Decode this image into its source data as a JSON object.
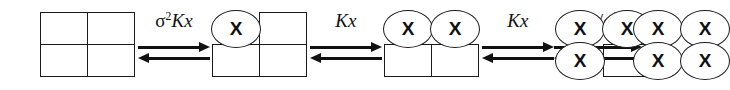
{
  "diagram": {
    "type": "reaction-scheme",
    "background_color": "#ffffff",
    "line_color": "#1a1a1a",
    "bound_marker": "X",
    "states": [
      {
        "id": "state-0",
        "name": "fully-unbound-lattice",
        "bound_count": 0,
        "sites": [
          {
            "position": "top-left",
            "occupied": false,
            "label": ""
          },
          {
            "position": "top-right",
            "occupied": false,
            "label": ""
          },
          {
            "position": "bottom-left",
            "occupied": false,
            "label": ""
          },
          {
            "position": "bottom-right",
            "occupied": false,
            "label": ""
          }
        ]
      },
      {
        "id": "state-1",
        "name": "singly-bound-lattice",
        "bound_count": 1,
        "sites": [
          {
            "position": "top-left",
            "occupied": true,
            "label": "X"
          },
          {
            "position": "top-right",
            "occupied": false,
            "label": ""
          },
          {
            "position": "bottom-left",
            "occupied": false,
            "label": ""
          },
          {
            "position": "bottom-right",
            "occupied": false,
            "label": ""
          }
        ]
      },
      {
        "id": "state-2",
        "name": "doubly-bound-lattice",
        "bound_count": 2,
        "sites": [
          {
            "position": "top-left",
            "occupied": true,
            "label": "X"
          },
          {
            "position": "top-right",
            "occupied": true,
            "label": "X"
          },
          {
            "position": "bottom-left",
            "occupied": false,
            "label": ""
          },
          {
            "position": "bottom-right",
            "occupied": false,
            "label": ""
          }
        ]
      },
      {
        "id": "state-3",
        "name": "triply-bound-lattice",
        "bound_count": 3,
        "sites": [
          {
            "position": "top-left",
            "occupied": true,
            "label": "X"
          },
          {
            "position": "top-right",
            "occupied": true,
            "label": "X"
          },
          {
            "position": "bottom-left",
            "occupied": true,
            "label": "X"
          },
          {
            "position": "bottom-right",
            "occupied": false,
            "label": ""
          }
        ]
      },
      {
        "id": "state-4",
        "name": "fully-bound-lattice",
        "bound_count": 4,
        "sites": [
          {
            "position": "top-left",
            "occupied": true,
            "label": "X"
          },
          {
            "position": "top-right",
            "occupied": true,
            "label": "X"
          },
          {
            "position": "bottom-left",
            "occupied": true,
            "label": "X"
          },
          {
            "position": "bottom-right",
            "occupied": true,
            "label": "X"
          }
        ]
      }
    ],
    "reactions": [
      {
        "id": "rxn-0",
        "name": "first-binding-step",
        "from": "state-0",
        "to": "state-1",
        "reversible": true,
        "constant_text": "σ²Kx",
        "constant_parts": {
          "prefix_sigma": "σ",
          "prefix_exponent": "2",
          "body": "Kx",
          "divisor_sigma": "",
          "divisor_exponent": ""
        }
      },
      {
        "id": "rxn-1",
        "name": "second-binding-step",
        "from": "state-1",
        "to": "state-2",
        "reversible": true,
        "constant_text": "Kx",
        "constant_parts": {
          "prefix_sigma": "",
          "prefix_exponent": "",
          "body": "Kx",
          "divisor_sigma": "",
          "divisor_exponent": ""
        }
      },
      {
        "id": "rxn-2",
        "name": "third-binding-step",
        "from": "state-2",
        "to": "state-3",
        "reversible": true,
        "constant_text": "Kx",
        "constant_parts": {
          "prefix_sigma": "",
          "prefix_exponent": "",
          "body": "Kx",
          "divisor_sigma": "",
          "divisor_exponent": ""
        }
      },
      {
        "id": "rxn-3",
        "name": "fourth-binding-step",
        "from": "state-3",
        "to": "state-4",
        "reversible": true,
        "constant_text": "Kx/σ²",
        "constant_parts": {
          "prefix_sigma": "",
          "prefix_exponent": "",
          "body": "Kx",
          "divisor_sigma": "σ",
          "divisor_exponent": "2"
        }
      }
    ]
  }
}
